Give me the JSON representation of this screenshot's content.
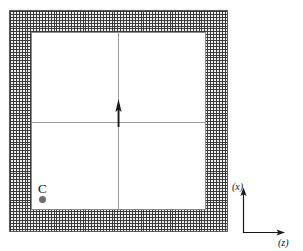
{
  "figure": {
    "background_color": "#ffffff"
  },
  "mesh_region": {
    "name": "mesh-frame",
    "description": "Hatched / finite-element meshed wall frame",
    "fill_color": "#f2f2f2",
    "line_color": "#3a3a3a",
    "border_color": "#5a5a5a",
    "cell_size_px": 2.9,
    "bounds": {
      "x": 9,
      "y": 10,
      "width": 219,
      "height": 222
    }
  },
  "cavity": {
    "name": "inner-cavity",
    "description": "Clear un-meshed interior region",
    "fill_color": "#ffffff",
    "border_color": "#8a8a8a",
    "bounds": {
      "x": 31,
      "y": 32,
      "width": 175,
      "height": 178
    }
  },
  "centre_lines": {
    "color": "#9a9a9a",
    "horizontal": {
      "x": 31,
      "y": 122,
      "length": 175
    },
    "vertical": {
      "x": 118,
      "y": 32,
      "length": 178
    }
  },
  "centre_arrow": {
    "name": "centre-arrow",
    "direction": "up",
    "color": "#1a1a1a",
    "x": 118,
    "y": 122
  },
  "point_c": {
    "label": "C",
    "marker_color": "#6f6f6f",
    "label_x": 38,
    "label_y": 182,
    "marker_x": 39,
    "marker_y": 196
  },
  "triad": {
    "name": "coordinate-triad",
    "origin": {
      "x": 243,
      "y": 233
    },
    "line_color": "#1a1a1a",
    "vertical_axis": {
      "label": "(x)",
      "direction": "up",
      "length": 44,
      "label_x": 232,
      "label_y": 182
    },
    "horizontal_axis": {
      "label": "(z)",
      "direction": "right",
      "length": 46,
      "label_x": 278,
      "label_y": 238
    }
  }
}
